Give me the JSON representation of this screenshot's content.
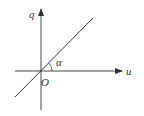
{
  "diagram": {
    "type": "axes-with-line",
    "labels": {
      "vertical_axis": "q",
      "horizontal_axis": "u",
      "origin": "O",
      "angle": "α"
    },
    "colors": {
      "stroke": "#333333",
      "background": "#ffffff"
    }
  }
}
